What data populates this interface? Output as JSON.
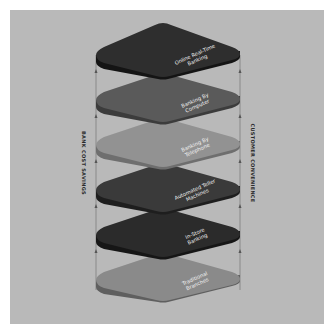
{
  "diagram": {
    "axes": {
      "left": "BANK COST SAVINGS",
      "right": "CUSTOMER CONVENIENCE"
    },
    "layers": [
      {
        "label_line1": "Online Real-Time",
        "label_line2": "Banking",
        "color": "#2e2e2e"
      },
      {
        "label_line1": "Banking By",
        "label_line2": "Computer",
        "color": "#5a5a5a"
      },
      {
        "label_line1": "Banking By",
        "label_line2": "Telephone",
        "color": "#8e8e8e"
      },
      {
        "label_line1": "Automated Teller",
        "label_line2": "Machines",
        "color": "#3a3a3a"
      },
      {
        "label_line1": "In-Store",
        "label_line2": "Banking",
        "color": "#2b2b2b"
      },
      {
        "label_line1": "Traditional",
        "label_line2": "Branches",
        "color": "#7d7d7d"
      }
    ]
  }
}
